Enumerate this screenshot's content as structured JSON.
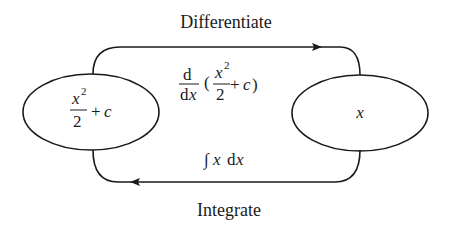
{
  "diagram": {
    "top_label": "Differentiate",
    "bottom_label": "Integrate",
    "left_node": {
      "numerator": "x",
      "exponent": "2",
      "denominator": "2",
      "suffix_op": "+",
      "suffix_var": "c"
    },
    "right_node": {
      "text": "x"
    },
    "top_arrow_expr": {
      "d_num": "d",
      "d_den_d": "d",
      "d_den_x": "x",
      "open_paren": "(",
      "numerator": "x",
      "exponent": "2",
      "denominator": "2",
      "plus": "+",
      "var": "c",
      "close_paren": ")"
    },
    "bottom_arrow_expr": {
      "integral": "∫",
      "var": "x",
      "d": "d",
      "dvar": "x"
    },
    "colors": {
      "stroke": "#1a1a1a",
      "background": "#ffffff"
    }
  }
}
